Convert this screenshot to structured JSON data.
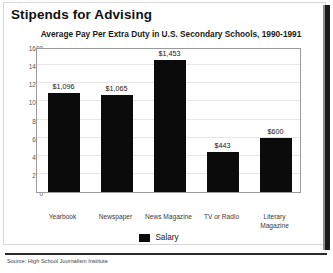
{
  "title": "Stipends for Advising",
  "subtitle": "Average Pay Per Extra Duty in U.S. Secondary Schools, 1990-1991",
  "source": "Source: High School Journalism Institute",
  "legend": {
    "label": "Salary",
    "swatch_color": "#0b0b0b"
  },
  "colors": {
    "bar": "#0b0b0b",
    "gridline": "#e6e6e6",
    "plot_border": "#9a9a9a",
    "text": "#151515"
  },
  "chart_data": {
    "type": "bar",
    "title": "Stipends for Advising",
    "subtitle": "Average Pay Per Extra Duty in U.S. Secondary Schools, 1990-1991",
    "xlabel": "",
    "ylabel": "",
    "ylim": [
      0,
      1600
    ],
    "ytick_step": 200,
    "yticks": [
      0,
      200,
      400,
      600,
      800,
      1000,
      1200,
      1400,
      1600
    ],
    "ytick_labels": [
      "0",
      "200",
      "400",
      "600",
      "800",
      "1000",
      "1200",
      "1400",
      "1600"
    ],
    "grid": true,
    "legend_position": "bottom-center",
    "categories": [
      "Yearbook",
      "Newspaper",
      "News Magazine",
      "TV or Radio",
      "Literary Magazine"
    ],
    "category_lines": [
      [
        "Yearbook"
      ],
      [
        "Newspaper"
      ],
      [
        "News Magazine"
      ],
      [
        "TV or Radio"
      ],
      [
        "Literary",
        "Magazine"
      ]
    ],
    "series": [
      {
        "name": "Salary",
        "values": [
          1096,
          1065,
          1453,
          443,
          600
        ],
        "data_labels": [
          "$1,096",
          "$1,065",
          "$1,453",
          "$443",
          "$600"
        ]
      }
    ]
  }
}
